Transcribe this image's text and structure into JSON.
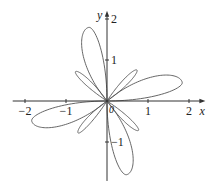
{
  "chart_data": {
    "type": "line",
    "subtype": "polar-curve",
    "title": "",
    "xlabel": "x",
    "ylabel": "y",
    "origin_label": "0",
    "xlim": [
      -2.3,
      2.4
    ],
    "ylim": [
      -1.95,
      2.2
    ],
    "x_ticks": [
      {
        "value": -2,
        "label": "−2"
      },
      {
        "value": -1,
        "label": "−1"
      },
      {
        "value": 1,
        "label": "1"
      },
      {
        "value": 2,
        "label": "2"
      }
    ],
    "y_ticks": [
      {
        "value": 2,
        "label": "2"
      },
      {
        "value": 1,
        "label": "1"
      },
      {
        "value": -1,
        "label": "−1"
      }
    ],
    "grid": false,
    "legend": null,
    "symmetry": "4-fold rotational (90 degrees)",
    "large_lobes": [
      {
        "start_deg": 0,
        "end_deg": 40,
        "peak_deg": 14,
        "peak_r": 1.89
      },
      {
        "start_deg": 90,
        "end_deg": 130,
        "peak_deg": 104,
        "peak_r": 1.85
      },
      {
        "start_deg": 180,
        "end_deg": 220,
        "peak_deg": 195,
        "peak_r": 1.9
      },
      {
        "start_deg": 270,
        "end_deg": 310,
        "peak_deg": 285,
        "peak_r": 1.86
      }
    ],
    "small_lobes": [
      {
        "start_deg": 35,
        "end_deg": 57,
        "peak_deg": 46,
        "peak_r": 1.05
      },
      {
        "start_deg": 125,
        "end_deg": 147,
        "peak_deg": 137,
        "peak_r": 1.05
      },
      {
        "start_deg": 215,
        "end_deg": 237,
        "peak_deg": 228,
        "peak_r": 1.05
      },
      {
        "start_deg": 305,
        "end_deg": 327,
        "peak_deg": 317,
        "peak_r": 1.05
      }
    ],
    "colors": {
      "curve": "#555555",
      "axis": "#333333",
      "text": "#222222"
    }
  },
  "layout": {
    "origin_px": [
      107,
      101
    ],
    "px_per_unit": 41
  }
}
